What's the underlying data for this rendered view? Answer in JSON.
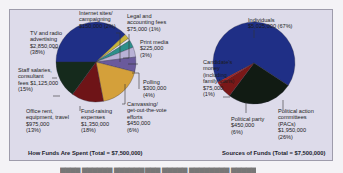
{
  "chart_data": [
    {
      "type": "pie",
      "title": "How Funds Are Spent (Total = $7,500,000)",
      "categories": [
        "TV and radio advertising",
        "Internet sites/ campaigning",
        "Legal and accounting fees",
        "Print media",
        "Polling",
        "Canvassing/ get-out-the-vote efforts",
        "Fund-raising expenses",
        "Office rent, equipment, travel",
        "Staff salaries, consultant fees"
      ],
      "values": [
        2850000,
        150000,
        75000,
        225000,
        300000,
        450000,
        1350000,
        975000,
        1125000
      ],
      "percents": [
        38,
        2,
        1,
        3,
        4,
        6,
        18,
        13,
        15
      ],
      "colors": [
        "#1f2f86",
        "#c9b43a",
        "#e8e6ef",
        "#2d8f8a",
        "#b9b2d6",
        "#6a5a9c",
        "#d4a03a",
        "#6e1417",
        "#152a1c"
      ]
    },
    {
      "type": "pie",
      "title": "Sources of Funds (Total = $7,500,000)",
      "categories": [
        "Individuals",
        "Political action committees (PACs)",
        "Political party",
        "Candidate's money (including family loans)"
      ],
      "values": [
        5025000,
        1950000,
        450000,
        75000
      ],
      "percents": [
        67,
        26,
        6,
        1
      ],
      "colors": [
        "#1f2f86",
        "#111b13",
        "#7a1818",
        "#b02020"
      ]
    }
  ],
  "left": {
    "caption": "How Funds Are Spent (Total = $7,500,000)",
    "labels": {
      "tv": "TV and radio\nadvertising\n$2,850,000\n(38%)",
      "internet": "Internet sites/\ncampaigning\n$150,000 (2%)",
      "legal": "Legal and\naccounting fees\n$75,000 (1%)",
      "print": "Print media\n$225,000\n(3%)",
      "polling": "Polling\n$300,000\n(4%)",
      "canvassing": "Canvassing/\nget-out-the-vote\nefforts\n$450,000\n(6%)",
      "fundraising": "Fund-raising\nexpenses\n$1,350,000\n(18%)",
      "office": "Office rent,\nequipment, travel\n$975,000\n(13%)",
      "staff": "Staff salaries,\nconsultant\nfees $1,125,000\n(15%)"
    }
  },
  "right": {
    "caption": "Sources of Funds (Total = $7,500,000)",
    "labels": {
      "individuals": "Individuals\n$5,025,000 (67%)",
      "candidate": "Candidate's\nmoney\n(including\nfamily loans)\n$75,000\n(1%)",
      "party": "Political party\n$450,000\n(6%)",
      "pacs": "Political action\ncommittees\n(PACs)\n$1,950,000\n(26%)"
    }
  }
}
